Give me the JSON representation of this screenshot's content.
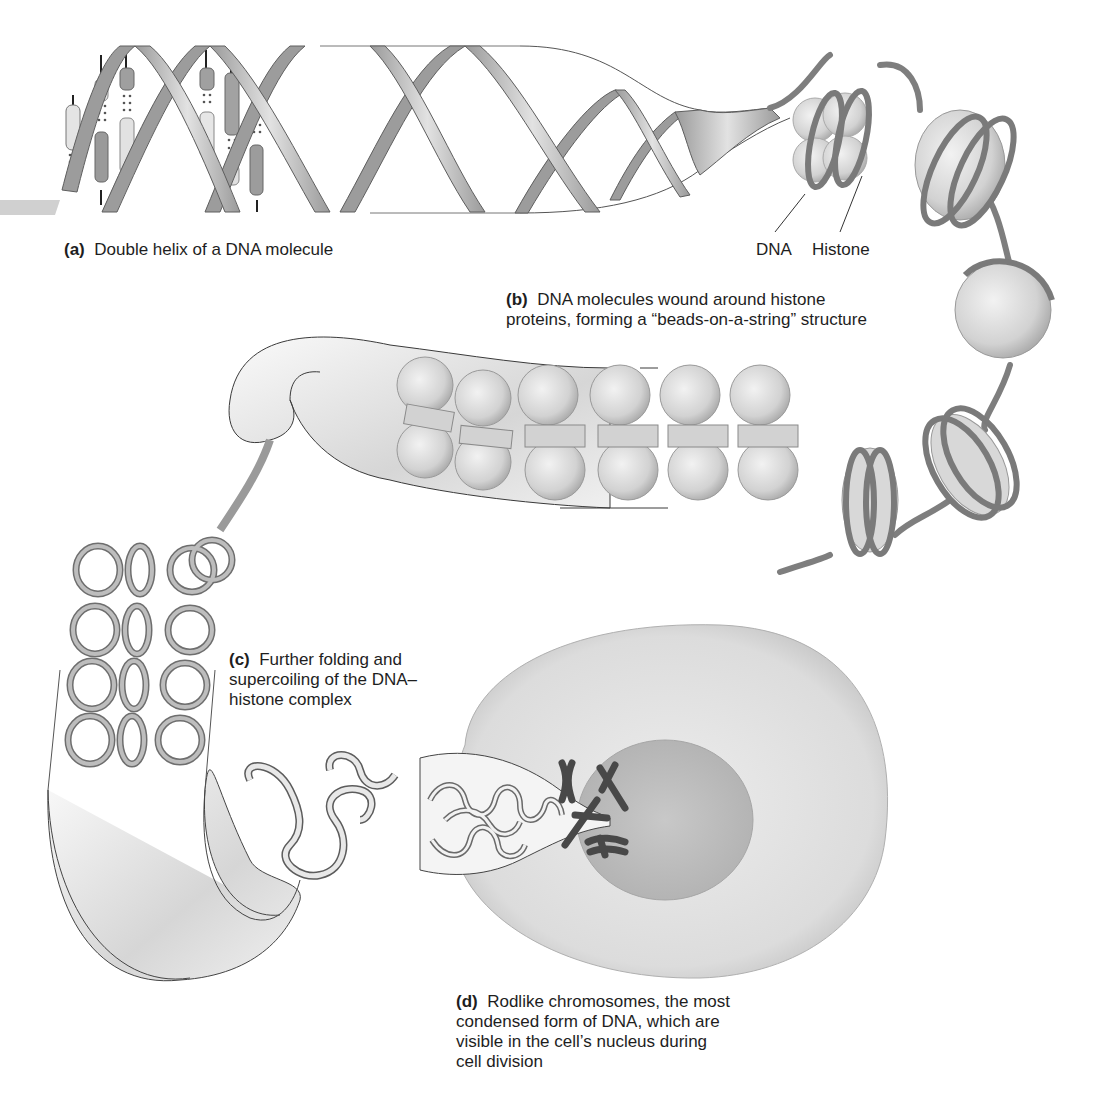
{
  "figure": {
    "panels": [
      {
        "id": "a",
        "tag": "(a)",
        "caption": "Double helix of a DNA molecule"
      },
      {
        "id": "b",
        "tag": "(b)",
        "caption_lines": [
          "DNA molecules wound around histone",
          "proteins, forming a “beads-on-a-string” structure"
        ]
      },
      {
        "id": "c",
        "tag": "(c)",
        "caption_lines": [
          "Further folding and",
          "supercoiling of the DNA–",
          "histone complex"
        ]
      },
      {
        "id": "d",
        "tag": "(d)",
        "caption_lines": [
          "Rodlike chromosomes, the most",
          "condensed form of DNA, which are",
          "visible in the cell’s nucleus during",
          "cell division"
        ]
      }
    ],
    "callouts": {
      "dna": "DNA",
      "histone": "Histone"
    },
    "colors": {
      "ribbon_dark": "#8c8c8c",
      "ribbon_light": "#d9d9d9",
      "histone_bead": "#dcdcdc",
      "dna_strand": "#7a7a7a",
      "coil_fill": "#b5b5b5",
      "cell": "#e6e6e6",
      "nucleus": "#c4c4c4",
      "chromosome": "#4a4a4a",
      "text": "#1e1e1e"
    }
  }
}
